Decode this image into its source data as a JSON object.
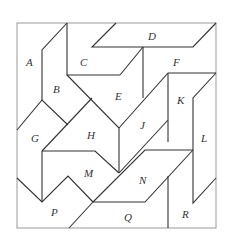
{
  "diagram": {
    "type": "tiling-puzzle",
    "frame": {
      "x1": 17,
      "y1": 23,
      "x2": 216,
      "y2": 228,
      "color": "#999999"
    },
    "line_color": "#333333",
    "pieces": [
      {
        "id": "A",
        "label": "A",
        "lx": 31,
        "ly": 63
      },
      {
        "id": "B",
        "label": "B",
        "lx": 57,
        "ly": 91
      },
      {
        "id": "C",
        "label": "C",
        "lx": 84,
        "ly": 64
      },
      {
        "id": "D",
        "label": "D",
        "lx": 152,
        "ly": 37
      },
      {
        "id": "E",
        "label": "E",
        "lx": 119,
        "ly": 98
      },
      {
        "id": "F",
        "label": "F",
        "lx": 177,
        "ly": 64
      },
      {
        "id": "G",
        "label": "G",
        "lx": 34,
        "ly": 140
      },
      {
        "id": "H",
        "label": "H",
        "lx": 91,
        "ly": 137
      },
      {
        "id": "J",
        "label": "J",
        "lx": 142,
        "ly": 127
      },
      {
        "id": "K",
        "label": "K",
        "lx": 181,
        "ly": 102
      },
      {
        "id": "L",
        "label": "L",
        "lx": 205,
        "ly": 140
      },
      {
        "id": "M",
        "label": "M",
        "lx": 88,
        "ly": 175
      },
      {
        "id": "N",
        "label": "N",
        "lx": 143,
        "ly": 182
      },
      {
        "id": "P",
        "label": "P",
        "lx": 55,
        "ly": 214
      },
      {
        "id": "Q",
        "label": "Q",
        "lx": 128,
        "ly": 219
      },
      {
        "id": "R",
        "label": "R",
        "lx": 186,
        "ly": 216
      }
    ]
  }
}
